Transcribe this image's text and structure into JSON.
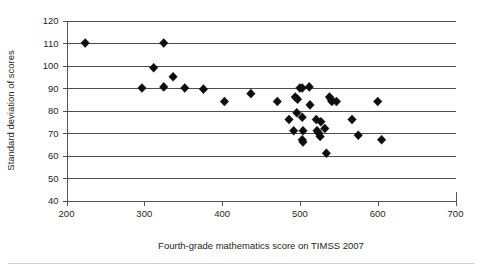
{
  "chart_data": {
    "type": "scatter",
    "title": "",
    "xlabel": "Fourth-grade mathematics score on TIMSS 2007",
    "ylabel": "Standard deviation of scores",
    "xlim": [
      200,
      700
    ],
    "ylim": [
      40,
      120
    ],
    "xticks": [
      200,
      300,
      400,
      500,
      600,
      700
    ],
    "yticks": [
      40,
      50,
      60,
      70,
      80,
      90,
      100,
      110,
      120
    ],
    "xtick_labels": [
      "200",
      "300",
      "400",
      "500",
      "600",
      "700"
    ],
    "ytick_labels": [
      "40",
      "50",
      "60",
      "70",
      "80",
      "90",
      "100",
      "110",
      "120"
    ],
    "grid": "horizontal",
    "legend": "none",
    "marker": "diamond",
    "marker_color": "#0d0d0d",
    "series": [
      {
        "name": "Countries",
        "points": [
          [
            224,
            110
          ],
          [
            325,
            110
          ],
          [
            312,
            99
          ],
          [
            337,
            95
          ],
          [
            297,
            90
          ],
          [
            325,
            90.5
          ],
          [
            352,
            90
          ],
          [
            376,
            89.5
          ],
          [
            403,
            84
          ],
          [
            437,
            87.5
          ],
          [
            471,
            84
          ],
          [
            486,
            76
          ],
          [
            492,
            71
          ],
          [
            494,
            86
          ],
          [
            497,
            85
          ],
          [
            496,
            79
          ],
          [
            500,
            90
          ],
          [
            503,
            90
          ],
          [
            503,
            77
          ],
          [
            504,
            71
          ],
          [
            503,
            67
          ],
          [
            504,
            66
          ],
          [
            512,
            90.5
          ],
          [
            513,
            82.5
          ],
          [
            521,
            76
          ],
          [
            522,
            71
          ],
          [
            524,
            70
          ],
          [
            526,
            68.5
          ],
          [
            527,
            75
          ],
          [
            532,
            72
          ],
          [
            534,
            61
          ],
          [
            538,
            86
          ],
          [
            540,
            85
          ],
          [
            541,
            84
          ],
          [
            547,
            84
          ],
          [
            567,
            76
          ],
          [
            575,
            69
          ],
          [
            600,
            84
          ],
          [
            605,
            67
          ]
        ]
      }
    ]
  }
}
